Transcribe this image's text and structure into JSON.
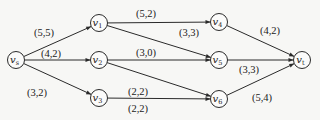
{
  "diagram": {
    "title": "",
    "type": "network flow graph",
    "colors": {
      "background": "#f7f7f5",
      "stroke": "#2a2a2a",
      "text": "#222222"
    },
    "nodes": [
      {
        "id": "vs",
        "label": "v",
        "sub": "s",
        "x": 16,
        "y": 60
      },
      {
        "id": "v1",
        "label": "v",
        "sub": "1",
        "x": 99,
        "y": 23
      },
      {
        "id": "v2",
        "label": "v",
        "sub": "2",
        "x": 99,
        "y": 60
      },
      {
        "id": "v3",
        "label": "v",
        "sub": "3",
        "x": 99,
        "y": 98
      },
      {
        "id": "v4",
        "label": "v",
        "sub": "4",
        "x": 219,
        "y": 22
      },
      {
        "id": "v5",
        "label": "v",
        "sub": "5",
        "x": 219,
        "y": 60
      },
      {
        "id": "v6",
        "label": "v",
        "sub": "6",
        "x": 219,
        "y": 99
      },
      {
        "id": "vt",
        "label": "v",
        "sub": "t",
        "x": 302,
        "y": 60
      }
    ],
    "edges": [
      {
        "from": "vs",
        "to": "v1",
        "label": "(5,5)",
        "lx": 44,
        "ly": 36
      },
      {
        "from": "vs",
        "to": "v2",
        "label": "(4,2)",
        "lx": 51,
        "ly": 57
      },
      {
        "from": "vs",
        "to": "v3",
        "label": "(3,2)",
        "lx": 37,
        "ly": 96
      },
      {
        "from": "v1",
        "to": "v4",
        "label": "(5,2)",
        "lx": 146,
        "ly": 17
      },
      {
        "from": "v1",
        "to": "v5",
        "label": "(3,3)",
        "lx": 189,
        "ly": 36
      },
      {
        "from": "v2",
        "to": "v5",
        "label": "(3,0)",
        "lx": 146,
        "ly": 56
      },
      {
        "from": "v2",
        "to": "v6",
        "label": "(2,2)",
        "lx": 138,
        "ly": 95
      },
      {
        "from": "v3",
        "to": "v6",
        "label": "(2,2)",
        "lx": 138,
        "ly": 112
      },
      {
        "from": "v4",
        "to": "vt",
        "label": "(4,2)",
        "lx": 270,
        "ly": 34
      },
      {
        "from": "v5",
        "to": "vt",
        "label": "(3,3)",
        "lx": 249,
        "ly": 73
      },
      {
        "from": "v6",
        "to": "vt",
        "label": "(5,4)",
        "lx": 262,
        "ly": 101
      }
    ]
  }
}
